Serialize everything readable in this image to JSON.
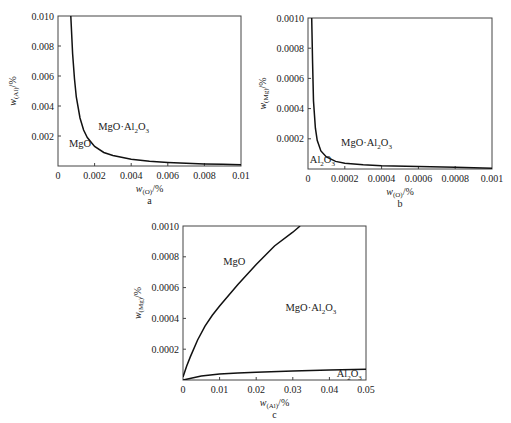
{
  "chart_data": [
    {
      "id": "a",
      "type": "line",
      "panel_label": "a",
      "xlabel": "w(O)/%",
      "ylabel": "w(Al)/%",
      "xlim": [
        0,
        0.01
      ],
      "ylim": [
        0,
        0.01
      ],
      "x_ticks": [
        0,
        0.002,
        0.004,
        0.006,
        0.008,
        0.01
      ],
      "x_tick_labels": [
        "0",
        "0.002",
        "0.004",
        "0.006",
        "0.008",
        "0.01"
      ],
      "y_ticks": [
        0.002,
        0.004,
        0.006,
        0.008,
        0.01
      ],
      "y_tick_labels": [
        "0.002",
        "0.004",
        "0.006",
        "0.008",
        "0.010"
      ],
      "grid": false,
      "series": [
        {
          "name": "MgO / MgO·Al2O3 boundary",
          "x": [
            0.0007,
            0.0008,
            0.0009,
            0.001,
            0.0012,
            0.0014,
            0.0016,
            0.002,
            0.0025,
            0.003,
            0.004,
            0.005,
            0.006,
            0.007,
            0.008,
            0.009,
            0.01
          ],
          "y": [
            0.01,
            0.0075,
            0.0058,
            0.0046,
            0.0032,
            0.0024,
            0.0019,
            0.0013,
            0.0009,
            0.0007,
            0.00045,
            0.00032,
            0.00024,
            0.00018,
            0.00014,
            0.00011,
            9e-05
          ]
        }
      ],
      "annotations": [
        {
          "text": "MgO·Al2O3",
          "x": 0.0022,
          "y": 0.0024
        },
        {
          "text": "MgO",
          "x": 0.0006,
          "y": 0.0013
        }
      ]
    },
    {
      "id": "b",
      "type": "line",
      "panel_label": "b",
      "xlabel": "w(O)/%",
      "ylabel": "w(Mg)/%",
      "xlim": [
        0,
        0.001
      ],
      "ylim": [
        0,
        0.001
      ],
      "x_ticks": [
        0,
        0.0002,
        0.0004,
        0.0006,
        0.0008,
        0.001
      ],
      "x_tick_labels": [
        "0",
        "0.0002",
        "0.0004",
        "0.0006",
        "0.0008",
        "0.001"
      ],
      "y_ticks": [
        0.0002,
        0.0004,
        0.0006,
        0.0008,
        0.001
      ],
      "y_tick_labels": [
        "0.0002",
        "0.0004",
        "0.0006",
        "0.0008",
        "0.0010"
      ],
      "grid": false,
      "series": [
        {
          "name": "Al2O3 / MgO·Al2O3 boundary",
          "x": [
            2e-05,
            2.5e-05,
            3e-05,
            4e-05,
            5e-05,
            7e-05,
            0.0001,
            0.00015,
            0.0002,
            0.0003,
            0.0004,
            0.0006,
            0.0008,
            0.001
          ],
          "y": [
            0.001,
            0.0007,
            0.00045,
            0.00027,
            0.00019,
            0.00012,
            8e-05,
            5e-05,
            3.8e-05,
            2.8e-05,
            2.2e-05,
            1.6e-05,
            1.1e-05,
            5e-06
          ]
        }
      ],
      "annotations": [
        {
          "text": "MgO·Al2O3",
          "x": 0.00018,
          "y": 0.00015
        },
        {
          "text": "Al2O3",
          "x": 1e-05,
          "y": 4e-05
        }
      ]
    },
    {
      "id": "c",
      "type": "line",
      "panel_label": "c",
      "xlabel": "w(Al)/%",
      "ylabel": "w(Mg)/%",
      "xlim": [
        0,
        0.05
      ],
      "ylim": [
        0,
        0.001
      ],
      "x_ticks": [
        0,
        0.01,
        0.02,
        0.03,
        0.04,
        0.05
      ],
      "x_tick_labels": [
        "0",
        "0.01",
        "0.02",
        "0.03",
        "0.04",
        "0.05"
      ],
      "y_ticks": [
        0.0002,
        0.0004,
        0.0006,
        0.0008,
        0.001
      ],
      "y_tick_labels": [
        "0.0002",
        "0.0004",
        "0.0006",
        "0.0008",
        "0.0010"
      ],
      "grid": false,
      "series": [
        {
          "name": "MgO / MgO·Al2O3 boundary",
          "x": [
            0,
            0.001,
            0.002,
            0.004,
            0.006,
            0.008,
            0.01,
            0.015,
            0.02,
            0.025,
            0.03,
            0.032
          ],
          "y": [
            2e-05,
            9e-05,
            0.00015,
            0.00026,
            0.00035,
            0.00042,
            0.00048,
            0.00062,
            0.00075,
            0.00087,
            0.00096,
            0.001
          ]
        },
        {
          "name": "MgO·Al2O3 / Al2O3 boundary",
          "x": [
            0,
            0.005,
            0.01,
            0.015,
            0.02,
            0.03,
            0.04,
            0.05
          ],
          "y": [
            0.0,
            2.5e-05,
            3.8e-05,
            4.5e-05,
            5e-05,
            5.8e-05,
            6.4e-05,
            7e-05
          ]
        }
      ],
      "annotations": [
        {
          "text": "MgO",
          "x": 0.011,
          "y": 0.00075
        },
        {
          "text": "MgO·Al2O3",
          "x": 0.028,
          "y": 0.00045
        },
        {
          "text": "Al2O3",
          "x": 0.042,
          "y": 2e-05
        }
      ]
    }
  ],
  "panels": [
    {
      "box": [
        58,
        16,
        241,
        166
      ],
      "ylabel_main": "w",
      "ylabel_sub": "(Al)",
      "ylabel_tail": "/%",
      "xlabel_main": "w",
      "xlabel_sub": "(O)",
      "xlabel_tail": "/%"
    },
    {
      "box": [
        308,
        18,
        492,
        169
      ],
      "ylabel_main": "w",
      "ylabel_sub": "(Mg)",
      "ylabel_tail": "/%",
      "xlabel_main": "w",
      "xlabel_sub": "(O)",
      "xlabel_tail": "/%"
    },
    {
      "box": [
        183,
        226,
        366,
        380
      ],
      "ylabel_main": "w",
      "ylabel_sub": "(Mg)",
      "ylabel_tail": "/%",
      "xlabel_main": "w",
      "xlabel_sub": "(Al)",
      "xlabel_tail": "/%"
    }
  ]
}
